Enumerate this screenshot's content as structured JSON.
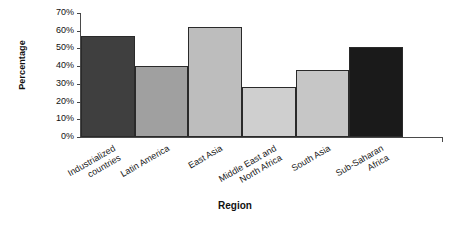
{
  "chart_data": {
    "type": "bar",
    "title": "",
    "xlabel": "Region",
    "ylabel": "Percentage",
    "categories": [
      "Industrialized countries",
      "Latin America",
      "East Asia",
      "Middle East and North Africa",
      "South Asia",
      "Sub-Saharan Africa"
    ],
    "category_lines": [
      [
        "Industrialized",
        "countries"
      ],
      [
        "Latin America"
      ],
      [
        "East Asia"
      ],
      [
        "Middle East and",
        "North Africa"
      ],
      [
        "South Asia"
      ],
      [
        "Sub-Saharan",
        "Africa"
      ]
    ],
    "values": [
      57,
      40,
      62,
      28,
      38,
      51
    ],
    "value_labels": [
      "57%",
      "40%",
      "62%",
      "28%",
      "38%",
      "51%"
    ],
    "bar_colors": [
      "#3f3f3f",
      "#a0a0a0",
      "#bdbdbd",
      "#cfcfcf",
      "#c6c6c6",
      "#1a1a1a"
    ],
    "bar_border_color": "#2a2a2a",
    "ylim": [
      0,
      70
    ],
    "ytick_values": [
      0,
      10,
      20,
      30,
      40,
      50,
      60,
      70
    ],
    "ytick_labels": [
      "0%",
      "10%",
      "20%",
      "30%",
      "40%",
      "50%",
      "60%",
      "70%"
    ],
    "grid": false,
    "legend": false,
    "legend_position": "none",
    "axis_color": "#4a4a4a",
    "background_color": "#ffffff"
  }
}
